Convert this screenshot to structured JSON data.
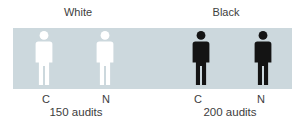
{
  "colors": {
    "page_background": "#ffffff",
    "band_background": "#ccd8dd",
    "white_figure": "#ffffff",
    "black_figure": "#141414",
    "text": "#3d3d3d"
  },
  "figure": {
    "groups": [
      {
        "label": "White",
        "audits": "150 audits",
        "columns": [
          {
            "letter": "C"
          },
          {
            "letter": "N"
          }
        ]
      },
      {
        "label": "Black",
        "audits": "200 audits",
        "columns": [
          {
            "letter": "C"
          },
          {
            "letter": "N"
          }
        ]
      }
    ]
  }
}
